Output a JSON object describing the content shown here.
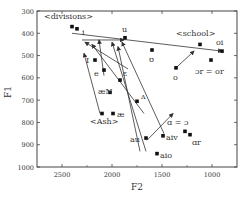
{
  "chart_data": {
    "type": "scatter",
    "title": "",
    "xlabel": "F2",
    "ylabel": "F1",
    "xlim": [
      2750,
      750
    ],
    "ylim": [
      1000,
      300
    ],
    "x_reversed": true,
    "y_reversed": true,
    "xticks": [
      2500,
      2000,
      1500,
      1000
    ],
    "yticks": [
      300,
      400,
      500,
      600,
      700,
      800,
      900,
      1000
    ],
    "grid": false,
    "points": [
      {
        "label": "<divisions>",
        "x": 2400,
        "y": 370,
        "lx": -28,
        "ly": -8
      },
      {
        "label": "i",
        "x": 2350,
        "y": 380,
        "lx": 5,
        "ly": 6
      },
      {
        "label": "u",
        "x": 1870,
        "y": 420,
        "lx": -3,
        "ly": -6
      },
      {
        "label": "I",
        "x": 2170,
        "y": 520,
        "lx": -9,
        "ly": 3
      },
      {
        "label": "e",
        "x": 2080,
        "y": 565,
        "lx": -10,
        "ly": 6
      },
      {
        "label": "ε",
        "x": 1920,
        "y": 610,
        "lx": 3,
        "ly": -4
      },
      {
        "label": "æN",
        "x": 2020,
        "y": 665,
        "lx": -12,
        "ly": 2
      },
      {
        "label": "ʌ",
        "x": 1750,
        "y": 705,
        "lx": 4,
        "ly": -2
      },
      {
        "label": "<Ash>",
        "x": 2100,
        "y": 760,
        "lx": -12,
        "ly": 10
      },
      {
        "label": "æ",
        "x": 1990,
        "y": 760,
        "lx": 4,
        "ly": 3
      },
      {
        "label": "au",
        "x": 1660,
        "y": 870,
        "lx": -16,
        "ly": 4
      },
      {
        "label": "aiv",
        "x": 1490,
        "y": 860,
        "lx": 3,
        "ly": 4
      },
      {
        "label": "aio",
        "x": 1550,
        "y": 940,
        "lx": 3,
        "ly": 4
      },
      {
        "label": "ʊ",
        "x": 1600,
        "y": 475,
        "lx": -3,
        "ly": 12
      },
      {
        "label": "o",
        "x": 1360,
        "y": 555,
        "lx": -3,
        "ly": 12
      },
      {
        "label": "<school>",
        "x": 1120,
        "y": 450,
        "lx": -24,
        "ly": -8
      },
      {
        "label": "oi",
        "x": 900,
        "y": 480,
        "lx": -6,
        "ly": -6
      },
      {
        "label": "ɔr = or",
        "x": 1010,
        "y": 520,
        "lx": -16,
        "ly": 14
      },
      {
        "label": "ɑ = ɔ",
        "x": 1270,
        "y": 840,
        "lx": -18,
        "ly": -6
      },
      {
        "label": "ɑr",
        "x": 1220,
        "y": 855,
        "lx": 2,
        "ly": 10
      }
    ],
    "arrows": [
      {
        "from": [
          2080,
          590
        ],
        "to": [
          2130,
          430
        ],
        "note": "e→ short up-left tip"
      },
      {
        "from": [
          1840,
          560
        ],
        "to": [
          2270,
          440
        ],
        "note": "ε line toward i"
      },
      {
        "from": [
          1680,
          760
        ],
        "to": [
          2200,
          450
        ]
      },
      {
        "from": [
          1720,
          930
        ],
        "to": [
          1940,
          460
        ]
      },
      {
        "from": [
          1660,
          930
        ],
        "to": [
          2000,
          440
        ]
      },
      {
        "from": [
          1480,
          850
        ],
        "to": [
          1900,
          440
        ]
      },
      {
        "from": [
          1650,
          880
        ],
        "to": [
          1390,
          760
        ]
      },
      {
        "from": [
          2120,
          760
        ],
        "to": [
          2280,
          490
        ]
      },
      {
        "from": [
          2300,
          430
        ],
        "to": [
          1880,
          430
        ]
      },
      {
        "from": [
          2400,
          400
        ],
        "to": [
          900,
          480
        ],
        "note": "long line to oi"
      },
      {
        "from": [
          1360,
          555
        ],
        "to": [
          1180,
          480
        ]
      }
    ]
  },
  "axes": {
    "x_label": "F2",
    "y_label": "F1",
    "x_tick_labels": [
      "2500",
      "2000",
      "1500",
      "1000"
    ],
    "y_tick_labels": [
      "300",
      "400",
      "500",
      "600",
      "700",
      "800",
      "900",
      "1000"
    ]
  }
}
